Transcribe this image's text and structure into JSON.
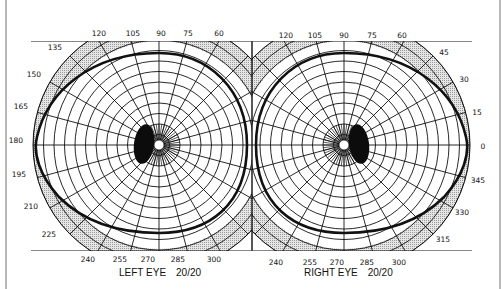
{
  "colors": {
    "ink": "#111111",
    "band": "#d4d4d4",
    "scotoma": "#0c0c0c",
    "background": "#ffffff"
  },
  "chart_data": {
    "type": "polar-perimetry",
    "charts": [
      {
        "name": "left-eye",
        "label": "LEFT EYE",
        "acuity": "20/20",
        "center": [
          159,
          145
        ],
        "meridian_labels": [
          "120",
          "105",
          "90",
          "75",
          "60",
          "135",
          "150",
          "165",
          "180",
          "195",
          "210",
          "225",
          "240",
          "255",
          "270",
          "285",
          "300"
        ],
        "field_boundary_extent_deg": {
          "temporal": 90,
          "nasal": 60,
          "superior": 60,
          "inferior": 70
        },
        "blind_spot": "temporal (left of fixation)"
      },
      {
        "name": "right-eye",
        "label": "RIGHT EYE",
        "acuity": "20/20",
        "center": [
          344,
          145
        ],
        "meridian_labels": [
          "120",
          "105",
          "90",
          "75",
          "60",
          "45",
          "30",
          "15",
          "0",
          "345",
          "330",
          "315",
          "240",
          "255",
          "270",
          "285",
          "300"
        ],
        "field_boundary_extent_deg": {
          "temporal": 90,
          "nasal": 60,
          "superior": 60,
          "inferior": 70
        },
        "blind_spot": "temporal (right of fixation)"
      }
    ]
  },
  "left_eye": {
    "label": "LEFT EYE",
    "acuity": "20/20",
    "ticks": [
      {
        "t": "120",
        "x": 99,
        "y": 36
      },
      {
        "t": "105",
        "x": 133,
        "y": 36
      },
      {
        "t": "90",
        "x": 161,
        "y": 36
      },
      {
        "t": "75",
        "x": 188,
        "y": 36
      },
      {
        "t": "60",
        "x": 219,
        "y": 36
      },
      {
        "t": "135",
        "x": 55,
        "y": 50
      },
      {
        "t": "150",
        "x": 34,
        "y": 77
      },
      {
        "t": "165",
        "x": 21,
        "y": 109
      },
      {
        "t": "180",
        "x": 16,
        "y": 143
      },
      {
        "t": "195",
        "x": 19,
        "y": 177
      },
      {
        "t": "210",
        "x": 31,
        "y": 209
      },
      {
        "t": "225",
        "x": 49,
        "y": 237
      },
      {
        "t": "240",
        "x": 88,
        "y": 262
      },
      {
        "t": "255",
        "x": 120,
        "y": 262
      },
      {
        "t": "270",
        "x": 148,
        "y": 262
      },
      {
        "t": "285",
        "x": 178,
        "y": 262
      },
      {
        "t": "300",
        "x": 214,
        "y": 262
      }
    ]
  },
  "right_eye": {
    "label": "RIGHT EYE",
    "acuity": "20/20",
    "ticks": [
      {
        "t": "120",
        "x": 286,
        "y": 38
      },
      {
        "t": "105",
        "x": 315,
        "y": 38
      },
      {
        "t": "90",
        "x": 344,
        "y": 38
      },
      {
        "t": "75",
        "x": 372,
        "y": 38
      },
      {
        "t": "60",
        "x": 402,
        "y": 38
      },
      {
        "t": "45",
        "x": 444,
        "y": 55
      },
      {
        "t": "30",
        "x": 464,
        "y": 82
      },
      {
        "t": "15",
        "x": 477,
        "y": 115
      },
      {
        "t": "0",
        "x": 483,
        "y": 149
      },
      {
        "t": "345",
        "x": 478,
        "y": 183
      },
      {
        "t": "330",
        "x": 462,
        "y": 215
      },
      {
        "t": "315",
        "x": 443,
        "y": 242
      },
      {
        "t": "240",
        "x": 276,
        "y": 265
      },
      {
        "t": "255",
        "x": 310,
        "y": 265
      },
      {
        "t": "270",
        "x": 337,
        "y": 265
      },
      {
        "t": "285",
        "x": 367,
        "y": 265
      },
      {
        "t": "300",
        "x": 399,
        "y": 265
      }
    ]
  }
}
